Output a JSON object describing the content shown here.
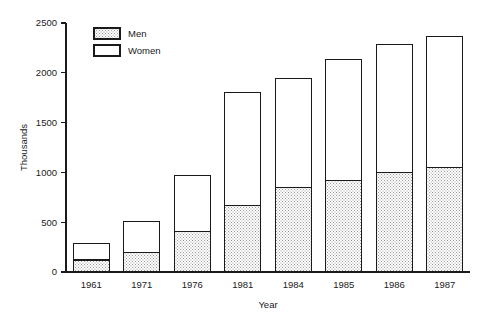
{
  "chart_data": {
    "type": "bar",
    "subtype": "stacked-vertical",
    "title": "",
    "subtitle": "",
    "xlabel": "Year",
    "ylabel": "Thousands",
    "categories": [
      "1961",
      "1971",
      "1976",
      "1981",
      "1984",
      "1985",
      "1986",
      "1987"
    ],
    "series": [
      {
        "name": "Men",
        "fill": "stipple",
        "values": [
          120,
          200,
          410,
          670,
          845,
          915,
          995,
          1045
        ]
      },
      {
        "name": "Women",
        "fill": "white",
        "values": [
          170,
          310,
          555,
          1130,
          1100,
          1220,
          1285,
          1320
        ]
      }
    ],
    "totals": [
      290,
      510,
      965,
      1800,
      1945,
      2135,
      2280,
      2365
    ],
    "ylim": [
      0,
      2500
    ],
    "yticks": [
      0,
      500,
      1000,
      1500,
      2000,
      2500
    ],
    "ytick_labels": [
      "0",
      "500",
      "1000",
      "1500",
      "2000",
      "2500"
    ],
    "grid": false,
    "legend": {
      "position": "top-left-inside",
      "entries": [
        {
          "label": "Men",
          "fill": "stipple"
        },
        {
          "label": "Women",
          "fill": "white"
        }
      ]
    },
    "axis_color": "#1a1a1a",
    "background_color": "#ffffff"
  }
}
